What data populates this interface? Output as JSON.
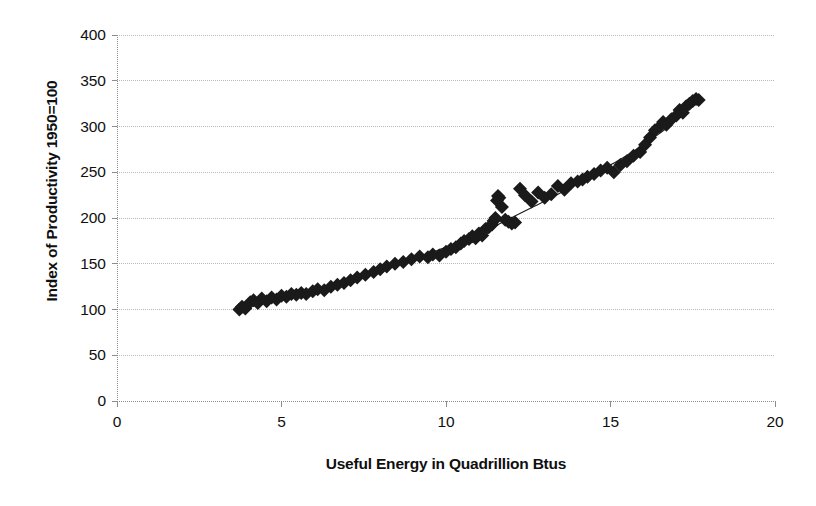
{
  "chart_data": {
    "type": "scatter",
    "title": "",
    "xlabel": "Useful Energy in Quadrillion Btus",
    "ylabel": "Index of Productivity 1950=100",
    "xlim": [
      0,
      20
    ],
    "ylim": [
      0,
      400
    ],
    "xticks": [
      0,
      5,
      10,
      15,
      20
    ],
    "yticks": [
      0,
      50,
      100,
      150,
      200,
      250,
      300,
      350,
      400
    ],
    "xtick_labels": [
      "0",
      "5",
      "10",
      "15",
      "20"
    ],
    "ytick_labels": [
      "0",
      "50",
      "100",
      "150",
      "200",
      "250",
      "300",
      "350",
      "400"
    ],
    "grid": true,
    "grid_axis": "y",
    "legend": false,
    "marker": "diamond",
    "marker_color": "#1a1a1a",
    "marker_size": 7,
    "gridline_color": "#b9b9b9",
    "axis_color": "#8c8c8c",
    "trendline": {
      "present": true,
      "style": "smooth-fit",
      "color": "#1a1a1a",
      "width": 1.1,
      "points": [
        [
          3.7,
          99
        ],
        [
          4.2,
          106
        ],
        [
          4.7,
          111
        ],
        [
          5.2,
          115
        ],
        [
          5.7,
          119
        ],
        [
          6.2,
          124
        ],
        [
          6.7,
          129
        ],
        [
          7.2,
          134
        ],
        [
          7.7,
          140
        ],
        [
          8.2,
          146
        ],
        [
          8.7,
          152
        ],
        [
          9.2,
          158
        ],
        [
          9.7,
          164
        ],
        [
          10.2,
          171
        ],
        [
          10.7,
          178
        ],
        [
          11.2,
          186
        ],
        [
          11.7,
          195
        ],
        [
          12.2,
          204
        ],
        [
          12.7,
          213
        ],
        [
          13.2,
          222
        ],
        [
          13.7,
          232
        ],
        [
          14.2,
          242
        ],
        [
          14.7,
          252
        ],
        [
          15.2,
          262
        ],
        [
          15.7,
          273
        ],
        [
          16.2,
          285
        ],
        [
          16.7,
          298
        ],
        [
          17.1,
          310
        ],
        [
          17.45,
          322
        ],
        [
          17.65,
          330
        ]
      ]
    },
    "series": [
      {
        "name": "Productivity vs Useful Energy",
        "points": [
          [
            3.72,
            100
          ],
          [
            3.8,
            103
          ],
          [
            3.9,
            101
          ],
          [
            4.05,
            108
          ],
          [
            4.15,
            110
          ],
          [
            4.28,
            107
          ],
          [
            4.4,
            112
          ],
          [
            4.55,
            109
          ],
          [
            4.7,
            113
          ],
          [
            4.85,
            111
          ],
          [
            5.0,
            115
          ],
          [
            5.15,
            114
          ],
          [
            5.3,
            117
          ],
          [
            5.45,
            116
          ],
          [
            5.6,
            118
          ],
          [
            5.75,
            117
          ],
          [
            5.95,
            120
          ],
          [
            6.1,
            122
          ],
          [
            6.3,
            121
          ],
          [
            6.5,
            125
          ],
          [
            6.7,
            127
          ],
          [
            6.9,
            129
          ],
          [
            7.1,
            132
          ],
          [
            7.3,
            135
          ],
          [
            7.55,
            138
          ],
          [
            7.8,
            141
          ],
          [
            8.0,
            144
          ],
          [
            8.2,
            147
          ],
          [
            8.45,
            150
          ],
          [
            8.7,
            152
          ],
          [
            8.95,
            155
          ],
          [
            9.2,
            158
          ],
          [
            9.45,
            157
          ],
          [
            9.6,
            160
          ],
          [
            9.8,
            159
          ],
          [
            10.0,
            163
          ],
          [
            10.15,
            166
          ],
          [
            10.3,
            168
          ],
          [
            10.45,
            172
          ],
          [
            10.55,
            175
          ],
          [
            10.7,
            177
          ],
          [
            10.8,
            180
          ],
          [
            10.9,
            178
          ],
          [
            11.0,
            183
          ],
          [
            11.1,
            181
          ],
          [
            11.2,
            188
          ],
          [
            11.3,
            190
          ],
          [
            11.4,
            193
          ],
          [
            11.45,
            197
          ],
          [
            11.5,
            200
          ],
          [
            11.55,
            219
          ],
          [
            11.58,
            224
          ],
          [
            11.62,
            222
          ],
          [
            11.7,
            212
          ],
          [
            11.8,
            198
          ],
          [
            11.9,
            196
          ],
          [
            12.0,
            194
          ],
          [
            12.1,
            195
          ],
          [
            12.25,
            232
          ],
          [
            12.4,
            225
          ],
          [
            12.6,
            218
          ],
          [
            12.8,
            228
          ],
          [
            13.0,
            222
          ],
          [
            13.2,
            226
          ],
          [
            13.4,
            235
          ],
          [
            13.6,
            231
          ],
          [
            13.8,
            238
          ],
          [
            14.0,
            240
          ],
          [
            14.15,
            242
          ],
          [
            14.3,
            245
          ],
          [
            14.5,
            248
          ],
          [
            14.7,
            252
          ],
          [
            14.9,
            255
          ],
          [
            15.1,
            250
          ],
          [
            15.3,
            258
          ],
          [
            15.5,
            262
          ],
          [
            15.7,
            268
          ],
          [
            15.9,
            272
          ],
          [
            16.05,
            280
          ],
          [
            16.2,
            288
          ],
          [
            16.35,
            296
          ],
          [
            16.5,
            300
          ],
          [
            16.6,
            305
          ],
          [
            16.7,
            302
          ],
          [
            16.85,
            308
          ],
          [
            17.0,
            312
          ],
          [
            17.1,
            318
          ],
          [
            17.2,
            315
          ],
          [
            17.3,
            322
          ],
          [
            17.4,
            325
          ],
          [
            17.5,
            328
          ],
          [
            17.6,
            330
          ],
          [
            17.68,
            329
          ]
        ]
      }
    ]
  },
  "geometry": {
    "plot_left": 117,
    "plot_right": 775,
    "plot_top": 35,
    "plot_bottom": 401
  }
}
